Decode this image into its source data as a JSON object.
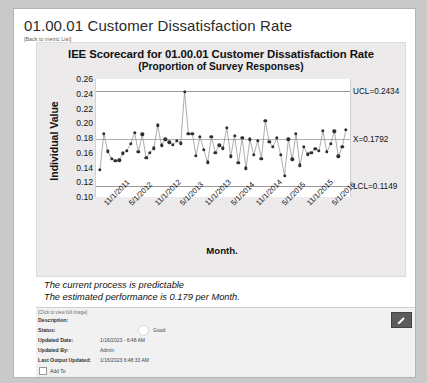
{
  "page": {
    "metric_title": "01.00.01 Customer Dissatisfaction Rate",
    "back_link": "[Back to metric List]"
  },
  "chart_card": {
    "title": "IEE Scorecard for 01.00.01 Customer Dissatisfaction Rate",
    "subtitle": "(Proportion of Survey Responses)"
  },
  "notes": {
    "line1": "The current process is predictable",
    "line2": "The estimated performance is 0.179 per Month."
  },
  "detail": {
    "click_full_image": "[Click to view full image]",
    "rows": [
      {
        "label": "Description:",
        "value": ""
      },
      {
        "label": "Status:",
        "value": "Good"
      },
      {
        "label": "Updated Date:",
        "value": "1/16/2023 - 6:48 AM"
      },
      {
        "label": "Updated By:",
        "value": "Admin"
      },
      {
        "label": "Last Output Updated:",
        "value": "1/16/2023 6:48:33 AM"
      }
    ],
    "add_to_label": "Add To",
    "edit_icon": "pencil-icon"
  },
  "chart_data": {
    "type": "line",
    "title": "IEE Scorecard for 01.00.01 Customer Dissatisfaction Rate",
    "subtitle": "(Proportion of Survey Responses)",
    "xlabel": "Month.",
    "ylabel": "Individual Value",
    "ylim": [
      0.1,
      0.26
    ],
    "yticks": [
      0.26,
      0.24,
      0.22,
      0.2,
      0.18,
      0.16,
      0.14,
      0.12,
      0.1
    ],
    "xtick_labels": [
      "11/1/2011",
      "5/1/2012",
      "11/1/2012",
      "5/1/2013",
      "11/1/2013",
      "5/1/2014",
      "11/1/2014",
      "5/1/2015",
      "11/1/2015",
      "5/1/2016"
    ],
    "grid": false,
    "legend": "none",
    "control_limits": {
      "UCL": {
        "value": 0.2434,
        "label": "UCL=0.2434"
      },
      "CL": {
        "value": 0.1792,
        "label": "X=0.1792"
      },
      "LCL": {
        "value": 0.1149,
        "label": "LCL=0.1149"
      }
    },
    "series": [
      {
        "name": "Individual Value",
        "marker": "filled-circle",
        "color": "#2f2f2f",
        "values": [
          0.137,
          0.186,
          0.162,
          0.152,
          0.149,
          0.15,
          0.159,
          0.163,
          0.172,
          0.187,
          0.161,
          0.185,
          0.153,
          0.16,
          0.166,
          0.197,
          0.17,
          0.178,
          0.174,
          0.171,
          0.176,
          0.173,
          0.243,
          0.186,
          0.186,
          0.156,
          0.182,
          0.164,
          0.147,
          0.182,
          0.16,
          0.17,
          0.166,
          0.194,
          0.155,
          0.183,
          0.146,
          0.18,
          0.139,
          0.178,
          0.157,
          0.176,
          0.152,
          0.203,
          0.175,
          0.168,
          0.18,
          0.157,
          0.129,
          0.178,
          0.151,
          0.186,
          0.143,
          0.168,
          0.158,
          0.16,
          0.165,
          0.163,
          0.19,
          0.161,
          0.172,
          0.189,
          0.155,
          0.168,
          0.191
        ]
      }
    ]
  }
}
